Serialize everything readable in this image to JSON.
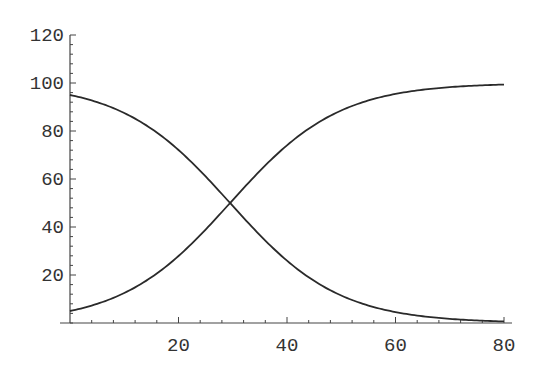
{
  "chart_data": {
    "type": "line",
    "title": "",
    "xlabel": "",
    "ylabel": "",
    "xlim": [
      0,
      80
    ],
    "ylim": [
      0,
      120
    ],
    "grid": false,
    "legend": null,
    "x_ticks": [
      20,
      40,
      60,
      80
    ],
    "y_ticks": [
      20,
      40,
      60,
      80,
      100,
      120
    ],
    "x_minor_step": 4,
    "y_minor_step": 4,
    "x": [
      0,
      5,
      10,
      15,
      20,
      25,
      29.5,
      35,
      40,
      45,
      50,
      55,
      60,
      65,
      70,
      75,
      80
    ],
    "series": [
      {
        "name": "increasing logistic",
        "values": [
          5.0,
          8.0,
          12.5,
          19.1,
          28.0,
          39.0,
          50.0,
          63.4,
          74.2,
          82.5,
          88.6,
          92.7,
          95.5,
          97.2,
          98.3,
          98.9,
          99.4
        ]
      },
      {
        "name": "decreasing logistic",
        "values": [
          95.0,
          92.0,
          87.5,
          80.9,
          72.0,
          61.0,
          50.0,
          36.6,
          25.8,
          17.5,
          11.4,
          7.3,
          4.5,
          2.8,
          1.7,
          1.1,
          0.6
        ]
      }
    ],
    "colors": {
      "curve": "#2a2a2a",
      "axis": "#444444",
      "text": "#333333",
      "background": "#ffffff"
    }
  }
}
